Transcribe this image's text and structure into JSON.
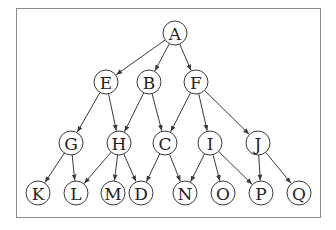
{
  "diagram": {
    "type": "directed-acyclic-graph",
    "node_radius": 12,
    "colors": {
      "stroke": "#3a3a3a",
      "text": "#222222",
      "frame": "#8a8a8a",
      "background": "#ffffff"
    },
    "nodes": [
      {
        "id": "A",
        "label": "A",
        "x": 175,
        "y": 33
      },
      {
        "id": "E",
        "label": "E",
        "x": 106,
        "y": 82
      },
      {
        "id": "B",
        "label": "B",
        "x": 149,
        "y": 82
      },
      {
        "id": "F",
        "label": "F",
        "x": 196,
        "y": 82
      },
      {
        "id": "G",
        "label": "G",
        "x": 71,
        "y": 143
      },
      {
        "id": "H",
        "label": "H",
        "x": 119,
        "y": 143
      },
      {
        "id": "C",
        "label": "C",
        "x": 165,
        "y": 143
      },
      {
        "id": "I",
        "label": "I",
        "x": 210,
        "y": 143
      },
      {
        "id": "J",
        "label": "J",
        "x": 258,
        "y": 143
      },
      {
        "id": "K",
        "label": "K",
        "x": 38,
        "y": 193
      },
      {
        "id": "L",
        "label": "L",
        "x": 76,
        "y": 193
      },
      {
        "id": "M",
        "label": "M",
        "x": 113,
        "y": 193
      },
      {
        "id": "D",
        "label": "D",
        "x": 141,
        "y": 193
      },
      {
        "id": "N",
        "label": "N",
        "x": 185,
        "y": 193
      },
      {
        "id": "O",
        "label": "O",
        "x": 223,
        "y": 193
      },
      {
        "id": "P",
        "label": "P",
        "x": 261,
        "y": 193
      },
      {
        "id": "Q",
        "label": "Q",
        "x": 299,
        "y": 193
      }
    ],
    "edges": [
      [
        "A",
        "E"
      ],
      [
        "A",
        "B"
      ],
      [
        "A",
        "F"
      ],
      [
        "E",
        "G"
      ],
      [
        "E",
        "H"
      ],
      [
        "B",
        "H"
      ],
      [
        "B",
        "C"
      ],
      [
        "F",
        "C"
      ],
      [
        "F",
        "I"
      ],
      [
        "F",
        "J"
      ],
      [
        "G",
        "K"
      ],
      [
        "G",
        "L"
      ],
      [
        "H",
        "L"
      ],
      [
        "H",
        "M"
      ],
      [
        "H",
        "D"
      ],
      [
        "C",
        "D"
      ],
      [
        "C",
        "N"
      ],
      [
        "I",
        "N"
      ],
      [
        "I",
        "O"
      ],
      [
        "I",
        "P"
      ],
      [
        "J",
        "P"
      ],
      [
        "J",
        "Q"
      ]
    ]
  }
}
